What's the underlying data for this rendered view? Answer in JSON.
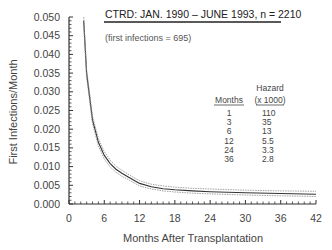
{
  "chart_data": {
    "type": "line",
    "title": "CTRD:  JAN. 1990 – JUNE 1993,  n = 2210",
    "subtitle": "(first infections  =  695)",
    "xlabel": "Months After Transplantation",
    "ylabel": "First Infections/Month",
    "xlim": [
      0,
      42
    ],
    "ylim": [
      0,
      0.05
    ],
    "x_ticks": [
      "0",
      "6",
      "12",
      "18",
      "24",
      "30",
      "36",
      "42"
    ],
    "y_ticks": [
      "0.000",
      "0.005",
      "0.010",
      "0.015",
      "0.020",
      "0.025",
      "0.030",
      "0.035",
      "0.040",
      "0.045",
      "0.050"
    ],
    "grid": false,
    "series": [
      {
        "name": "Hazard estimate",
        "x": [
          2.5,
          3,
          4,
          5,
          6,
          7,
          8,
          9,
          10,
          12,
          14,
          16,
          18,
          21,
          24,
          30,
          36,
          42
        ],
        "values": [
          0.049,
          0.035,
          0.0225,
          0.0165,
          0.013,
          0.0108,
          0.0093,
          0.0082,
          0.0073,
          0.0055,
          0.0046,
          0.0041,
          0.0038,
          0.0035,
          0.0033,
          0.003,
          0.0028,
          0.0026
        ]
      },
      {
        "name": "Upper confidence limit",
        "x": [
          2.5,
          3,
          4,
          5,
          6,
          7,
          8,
          9,
          10,
          12,
          14,
          16,
          18,
          21,
          24,
          30,
          36,
          42
        ],
        "values": [
          0.05,
          0.036,
          0.0235,
          0.0175,
          0.014,
          0.0117,
          0.0101,
          0.009,
          0.008,
          0.0062,
          0.0053,
          0.0048,
          0.0045,
          0.0042,
          0.004,
          0.0037,
          0.0035,
          0.0034
        ]
      },
      {
        "name": "Lower confidence limit",
        "x": [
          2.5,
          3,
          4,
          5,
          6,
          7,
          8,
          9,
          10,
          12,
          14,
          16,
          18,
          21,
          24,
          30,
          36,
          42
        ],
        "values": [
          0.048,
          0.034,
          0.0215,
          0.0155,
          0.012,
          0.0099,
          0.0085,
          0.0074,
          0.0066,
          0.0048,
          0.004,
          0.0035,
          0.0032,
          0.0029,
          0.0027,
          0.0024,
          0.0022,
          0.002
        ]
      }
    ],
    "table": {
      "headers": [
        "Months",
        "Hazard",
        "(x 1000)"
      ],
      "rows": [
        {
          "months": "1",
          "hazard": "110"
        },
        {
          "months": "3",
          "hazard": "35"
        },
        {
          "months": "6",
          "hazard": "13"
        },
        {
          "months": "12",
          "hazard": "5.5"
        },
        {
          "months": "24",
          "hazard": "3.3"
        },
        {
          "months": "36",
          "hazard": "2.8"
        }
      ]
    }
  }
}
